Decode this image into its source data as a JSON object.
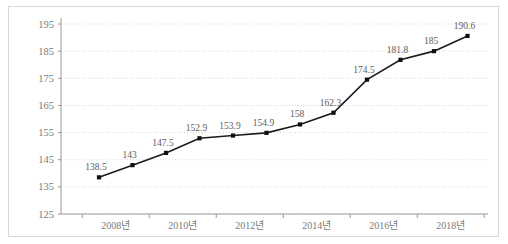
{
  "chart_data": {
    "type": "line",
    "title": "",
    "subtitle": "",
    "xlabel": "",
    "ylabel": "",
    "grid": true,
    "legend": false,
    "legend_position": "none",
    "series_color": "#1c1c1c",
    "marker": "square",
    "data_labels": true,
    "ylim": [
      125,
      195
    ],
    "ytick_step": 10,
    "ytick_labels": [
      "125",
      "135",
      "145",
      "155",
      "165",
      "175",
      "185",
      "195"
    ],
    "xtick_labels": [
      "2008년",
      "2010년",
      "2012년",
      "2014년",
      "2016년",
      "2018년"
    ],
    "x": [
      "2008",
      "2009",
      "2010",
      "2011",
      "2012",
      "2013",
      "2014",
      "2015",
      "2016",
      "2017",
      "2018",
      "2019"
    ],
    "categories": [
      "2008",
      "2009",
      "2010",
      "2011",
      "2012",
      "2013",
      "2014",
      "2015",
      "2016",
      "2017",
      "2018",
      "2019"
    ],
    "values": [
      138.5,
      143,
      147.5,
      152.9,
      153.9,
      154.9,
      158,
      162.3,
      174.5,
      181.8,
      185,
      190.6
    ],
    "value_labels": [
      "138.5",
      "143",
      "147.5",
      "152.9",
      "153.9",
      "154.9",
      "158",
      "162.3",
      "174.5",
      "181.8",
      "185",
      "190.6"
    ],
    "series": [
      {
        "name": "",
        "values": [
          138.5,
          143,
          147.5,
          152.9,
          153.9,
          154.9,
          158,
          162.3,
          174.5,
          181.8,
          185,
          190.6
        ]
      }
    ]
  }
}
